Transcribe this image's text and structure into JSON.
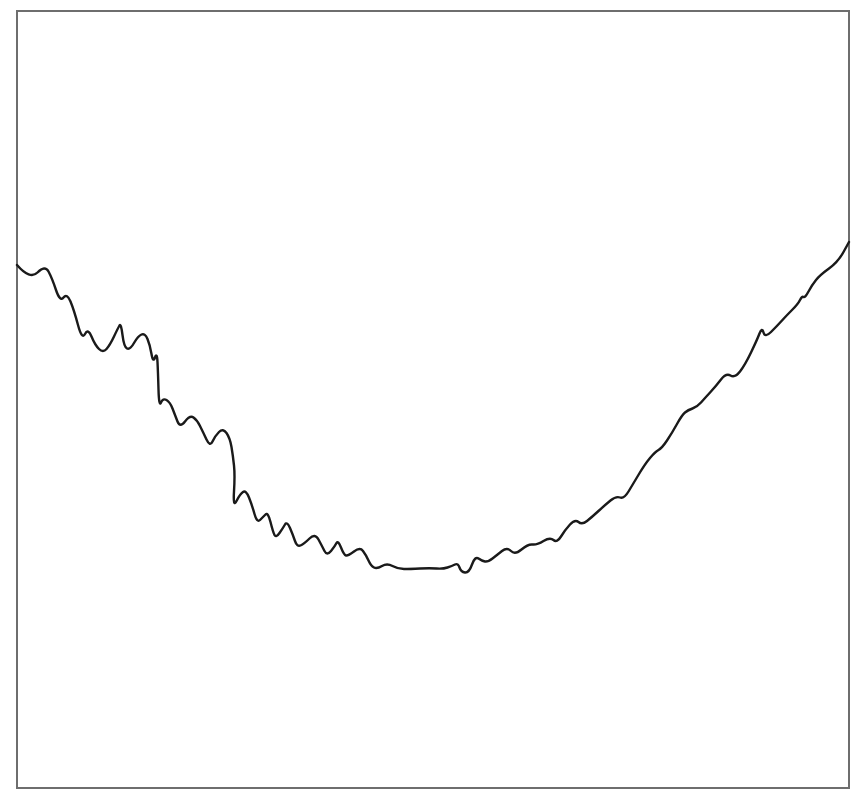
{
  "chart_data": {
    "type": "line",
    "title": "",
    "xlabel": "",
    "ylabel": "",
    "grid": false,
    "legend": null,
    "axes_visible": false,
    "frame": {
      "left": 17,
      "top": 11,
      "right": 849,
      "bottom": 788,
      "color": "#6e6e6e"
    },
    "series": [
      {
        "name": "series-1",
        "color": "#1a1a1a",
        "points_px": [
          [
            17,
            265
          ],
          [
            30,
            280
          ],
          [
            45,
            265
          ],
          [
            52,
            278
          ],
          [
            60,
            302
          ],
          [
            67,
            293
          ],
          [
            74,
            310
          ],
          [
            82,
            340
          ],
          [
            88,
            328
          ],
          [
            95,
            345
          ],
          [
            103,
            353
          ],
          [
            110,
            345
          ],
          [
            118,
            328
          ],
          [
            121,
            323
          ],
          [
            124,
            347
          ],
          [
            130,
            350
          ],
          [
            138,
            336
          ],
          [
            145,
            333
          ],
          [
            150,
            345
          ],
          [
            153,
            363
          ],
          [
            157,
            352
          ],
          [
            158,
            372
          ],
          [
            159,
            407
          ],
          [
            163,
            398
          ],
          [
            170,
            402
          ],
          [
            175,
            415
          ],
          [
            180,
            428
          ],
          [
            190,
            415
          ],
          [
            197,
            420
          ],
          [
            203,
            432
          ],
          [
            210,
            447
          ],
          [
            215,
            436
          ],
          [
            223,
            428
          ],
          [
            230,
            438
          ],
          [
            233,
            456
          ],
          [
            235,
            475
          ],
          [
            233,
            508
          ],
          [
            240,
            494
          ],
          [
            246,
            490
          ],
          [
            252,
            505
          ],
          [
            257,
            523
          ],
          [
            263,
            517
          ],
          [
            268,
            512
          ],
          [
            273,
            532
          ],
          [
            276,
            538
          ],
          [
            283,
            528
          ],
          [
            287,
            521
          ],
          [
            293,
            535
          ],
          [
            297,
            547
          ],
          [
            304,
            544
          ],
          [
            315,
            533
          ],
          [
            322,
            546
          ],
          [
            327,
            556
          ],
          [
            335,
            546
          ],
          [
            338,
            540
          ],
          [
            344,
            555
          ],
          [
            348,
            556
          ],
          [
            360,
            547
          ],
          [
            366,
            555
          ],
          [
            371,
            566
          ],
          [
            377,
            569
          ],
          [
            387,
            563
          ],
          [
            398,
            569
          ],
          [
            410,
            569
          ],
          [
            430,
            568
          ],
          [
            443,
            569
          ],
          [
            452,
            566
          ],
          [
            458,
            563
          ],
          [
            461,
            572
          ],
          [
            469,
            573
          ],
          [
            475,
            556
          ],
          [
            482,
            561
          ],
          [
            488,
            562
          ],
          [
            497,
            555
          ],
          [
            507,
            547
          ],
          [
            515,
            555
          ],
          [
            528,
            544
          ],
          [
            537,
            545
          ],
          [
            550,
            537
          ],
          [
            557,
            543
          ],
          [
            565,
            530
          ],
          [
            575,
            519
          ],
          [
            582,
            525
          ],
          [
            592,
            517
          ],
          [
            605,
            505
          ],
          [
            616,
            496
          ],
          [
            624,
            499
          ],
          [
            633,
            484
          ],
          [
            645,
            464
          ],
          [
            655,
            452
          ],
          [
            662,
            448
          ],
          [
            672,
            433
          ],
          [
            682,
            415
          ],
          [
            688,
            410
          ],
          [
            697,
            407
          ],
          [
            705,
            398
          ],
          [
            716,
            386
          ],
          [
            726,
            373
          ],
          [
            735,
            378
          ],
          [
            745,
            365
          ],
          [
            757,
            340
          ],
          [
            762,
            327
          ],
          [
            765,
            338
          ],
          [
            777,
            326
          ],
          [
            787,
            315
          ],
          [
            798,
            304
          ],
          [
            802,
            296
          ],
          [
            805,
            298
          ],
          [
            812,
            285
          ],
          [
            820,
            275
          ],
          [
            838,
            262
          ],
          [
            849,
            242
          ]
        ],
        "values_normalized": {
          "note_x": "0 = left frame edge, 1 = right frame edge",
          "note_y": "0 = bottom frame edge, 1 = top frame edge",
          "start": [
            0.0,
            0.676
          ],
          "min": [
            0.53,
            0.277
          ],
          "end": [
            1.0,
            0.703
          ]
        }
      }
    ],
    "shape_description": "U-shaped noisy curve: descends from left with oscillations, flattens at minimum near center-right, rises steadily to the right edge"
  }
}
